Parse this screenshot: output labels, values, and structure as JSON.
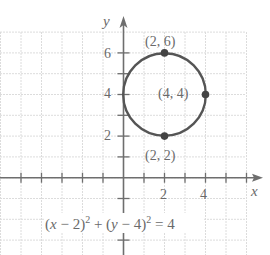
{
  "chart_data": {
    "type": "scatter",
    "title": "",
    "xlabel": "x",
    "ylabel": "y",
    "xlim": [
      -6,
      6
    ],
    "ylim": [
      -3,
      7
    ],
    "grid": true,
    "x_tick_labels": [
      "2",
      "4"
    ],
    "y_tick_labels": [
      "2",
      "4",
      "6"
    ],
    "curve": {
      "kind": "circle",
      "center": [
        2,
        4
      ],
      "radius": 2,
      "equation": "(x − 2)² + (y − 4)² = 4"
    },
    "points": [
      {
        "x": 2,
        "y": 6,
        "label": "(2, 6)"
      },
      {
        "x": 4,
        "y": 4,
        "label": "(4, 4)"
      },
      {
        "x": 2,
        "y": 2,
        "label": "(2, 2)"
      }
    ]
  },
  "labels": {
    "x_axis": "x",
    "y_axis": "y",
    "xt2": "2",
    "xt4": "4",
    "yt2": "2",
    "yt4": "4",
    "yt6": "6",
    "p_top": "(2, 6)",
    "p_right": "(4, 4)",
    "p_bottom": "(2, 2)",
    "eq_open1": "(",
    "eq_x": "x",
    "eq_part1": " − 2)",
    "eq_exp1": "2",
    "eq_plus": " + (",
    "eq_y": "y",
    "eq_part2": " − 4)",
    "eq_exp2": "2",
    "eq_tail": " = 4"
  },
  "colors": {
    "grid": "#dcdcdc",
    "axis": "#6e6e6e",
    "curve": "#555555",
    "point": "#444444",
    "text": "#6a6a6a"
  }
}
